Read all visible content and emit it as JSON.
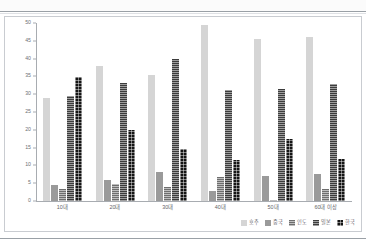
{
  "chart_data": {
    "type": "bar",
    "title": "",
    "xlabel": "",
    "ylabel": "",
    "ylim": [
      0,
      50
    ],
    "yticks": [
      0,
      5,
      10,
      15,
      20,
      25,
      30,
      35,
      40,
      45,
      50
    ],
    "grid": false,
    "legend_position": "bottom-right",
    "categories": [
      "10대",
      "20대",
      "30대",
      "40대",
      "50대",
      "60대 이상"
    ],
    "series": [
      {
        "name": "호주",
        "color": "#d5d5d5",
        "pattern": "solid",
        "values": [
          28.8,
          37.8,
          35.4,
          49.5,
          45.4,
          46.0
        ]
      },
      {
        "name": "중국",
        "color": "#9a9a9a",
        "pattern": "solid",
        "values": [
          4.6,
          6.0,
          8.1,
          2.8,
          7.1,
          7.7
        ]
      },
      {
        "name": "인도",
        "color": "#6e6e6e",
        "pattern": "horizontal",
        "values": [
          3.5,
          4.9,
          3.9,
          6.8,
          0.3,
          3.3
        ]
      },
      {
        "name": "일본",
        "color": "#3c3c3c",
        "pattern": "horizontal",
        "values": [
          29.4,
          33.1,
          39.8,
          31.2,
          31.4,
          33.0
        ]
      },
      {
        "name": "한국",
        "color": "#141414",
        "pattern": "grid",
        "values": [
          34.9,
          19.9,
          14.5,
          11.6,
          17.4,
          11.9
        ]
      }
    ]
  },
  "legend": {
    "items": [
      {
        "label": "호주"
      },
      {
        "label": "중국"
      },
      {
        "label": "인도"
      },
      {
        "label": "일본"
      },
      {
        "label": "한국"
      }
    ]
  }
}
